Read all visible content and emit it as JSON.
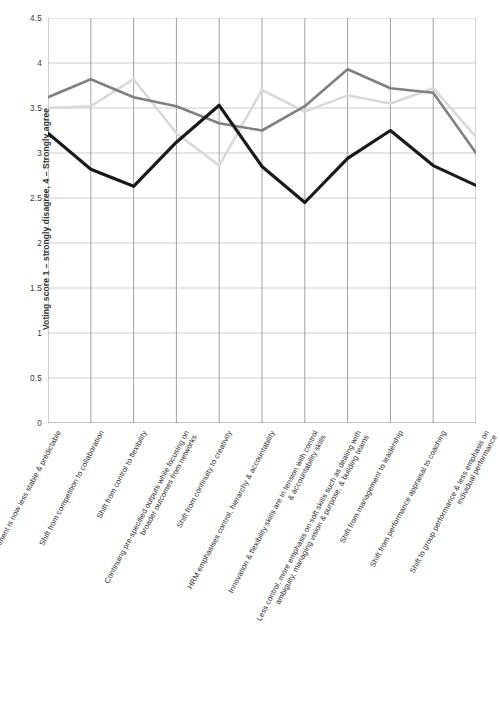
{
  "chart_data": {
    "type": "line",
    "title": "",
    "xlabel": "",
    "ylabel": "Voting score 1 – strongly disagree, 4 – Strongly agree",
    "ylim": [
      0,
      4.5
    ],
    "yticks": [
      "0",
      "0.5",
      "1",
      "1.5",
      "2",
      "2.5",
      "3",
      "3.5",
      "4",
      "4.5"
    ],
    "ytick_values": [
      0,
      0.5,
      1,
      1.5,
      2,
      2.5,
      3,
      3.5,
      4,
      4.5
    ],
    "grid": true,
    "legend": "none",
    "categories": [
      "Environment is now less stable & predictable",
      "Shift from competition to collaboration",
      "Shift from control to flexibility",
      "Continuing pre-specified outputs while focusing on\nbroader outcomes from networks",
      "Shift from continuity to creativity",
      "HRM emphasises control, hierarchy & accountability",
      "Innovation & flexibility skills are in tension with control\n& accountability skills",
      "Less control, more emphasis on soft skills such as dealing with\nambiguity, managing vision & purpose, & building teams",
      "Shift from management to leadership",
      "Shift from performance appraisal to coaching",
      "Shift to group performance & less emphasis on\nindividual performance"
    ],
    "series": [
      {
        "name": "series-dark-gray",
        "color": "#808080",
        "values": [
          3.62,
          3.82,
          3.62,
          3.52,
          3.33,
          3.25,
          3.52,
          3.93,
          3.72,
          3.67,
          3.0
        ]
      },
      {
        "name": "series-light-gray",
        "color": "#d9d9d9",
        "values": [
          3.5,
          3.52,
          3.82,
          3.22,
          2.86,
          3.7,
          3.46,
          3.64,
          3.55,
          3.72,
          3.18
        ]
      },
      {
        "name": "series-black",
        "color": "#1a1a1a",
        "values": [
          3.22,
          2.82,
          2.63,
          3.12,
          3.53,
          2.85,
          2.45,
          2.94,
          3.25,
          2.86,
          2.64
        ]
      }
    ]
  }
}
